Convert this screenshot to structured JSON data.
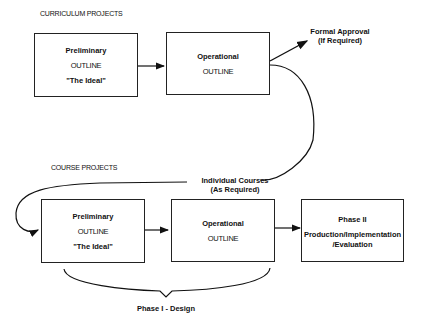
{
  "curriculum": {
    "label": "CURRICULUM PROJECTS",
    "preliminary": {
      "title": "Preliminary",
      "outline": "OUTLINE",
      "subtitle": "\"The Ideal\""
    },
    "operational": {
      "title": "Operational",
      "outline": "OUTLINE"
    },
    "approval": {
      "line1": "Formal Approval",
      "line2": "(If Required)"
    }
  },
  "course": {
    "label": "COURSE PROJECTS",
    "connector": {
      "line1": "Individual Courses",
      "line2": "(As Required)"
    },
    "preliminary": {
      "title": "Preliminary",
      "outline": "OUTLINE",
      "subtitle": "\"The Ideal\""
    },
    "operational": {
      "title": "Operational",
      "outline": "OUTLINE"
    },
    "phase2": {
      "title": "Phase II",
      "line1": "Production/Implementation",
      "line2": "/Evaluation"
    },
    "brace_label": "Phase I - Design"
  }
}
